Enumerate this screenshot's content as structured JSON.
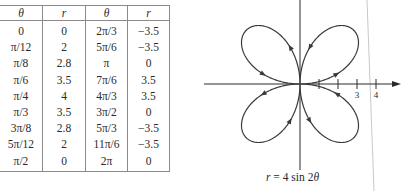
{
  "table": {
    "headers": [
      "θ",
      "r",
      "θ",
      "r"
    ],
    "rows": [
      [
        "0",
        "0",
        "2π/3",
        "−3.5"
      ],
      [
        "π/12",
        "2",
        "5π/6",
        "−3.5"
      ],
      [
        "π/8",
        "2.8",
        "π",
        "0"
      ],
      [
        "π/6",
        "3.5",
        "7π/6",
        "3.5"
      ],
      [
        "π/4",
        "4",
        "4π/3",
        "3.5"
      ],
      [
        "π/3",
        "3.5",
        "3π/2",
        "0"
      ],
      [
        "3π/8",
        "2.8",
        "5π/3",
        "−3.5"
      ],
      [
        "5π/12",
        "2",
        "11π/6",
        "−3.5"
      ],
      [
        "π/2",
        "0",
        "2π",
        "0"
      ]
    ]
  },
  "graph": {
    "caption_lhs": "r",
    "caption_rest": " = 4 sin 2",
    "caption_theta": "θ",
    "tick_labels": [
      "3",
      "4"
    ]
  },
  "chart_data": {
    "type": "line",
    "title": "r = 4 sin 2θ",
    "equation": "r = 4 sin 2θ",
    "coordinate_system": "polar",
    "amplitude": 4,
    "frequency": 2,
    "theta_range": [
      0,
      6.283185
    ],
    "axis_ticks": [
      1,
      2,
      3,
      4
    ],
    "axis_tick_labels": [
      "",
      "",
      "3",
      "4"
    ],
    "grid": false,
    "points": {
      "theta": [
        "0",
        "π/12",
        "π/8",
        "π/6",
        "π/4",
        "π/3",
        "3π/8",
        "5π/12",
        "π/2",
        "2π/3",
        "5π/6",
        "π",
        "7π/6",
        "4π/3",
        "3π/2",
        "5π/3",
        "11π/6",
        "2π"
      ],
      "r": [
        0,
        2,
        2.8,
        3.5,
        4,
        3.5,
        2.8,
        2,
        0,
        -3.5,
        -3.5,
        0,
        3.5,
        3.5,
        0,
        -3.5,
        -3.5,
        0
      ]
    },
    "curve_color": "#3a3a3a",
    "axis_color": "#2a2a2a"
  }
}
